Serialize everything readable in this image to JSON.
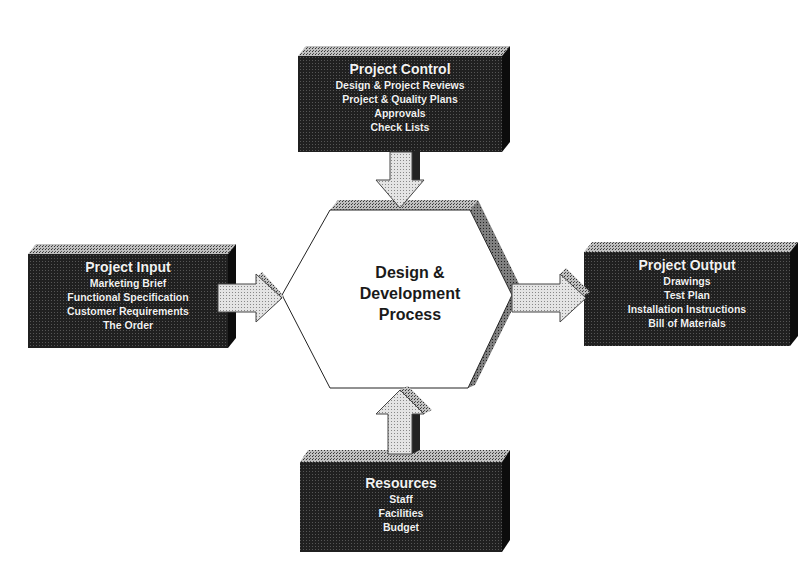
{
  "diagram": {
    "center": {
      "lines": [
        "Design &",
        "Development",
        "Process"
      ]
    },
    "boxes": {
      "top": {
        "title": "Project Control",
        "items": [
          "Design & Project Reviews",
          "Project & Quality Plans",
          "Approvals",
          "Check Lists"
        ]
      },
      "left": {
        "title": "Project Input",
        "items": [
          "Marketing Brief",
          "Functional Specification",
          "Customer Requirements",
          "The Order"
        ]
      },
      "right": {
        "title": "Project Output",
        "items": [
          "Drawings",
          "Test Plan",
          "Installation Instructions",
          "Bill of Materials"
        ]
      },
      "bottom": {
        "title": "Resources",
        "items": [
          "Staff",
          "Facilities",
          "Budget"
        ]
      }
    },
    "arrows": [
      {
        "from": "Project Control",
        "to": "Design & Development Process",
        "direction": "down"
      },
      {
        "from": "Project Input",
        "to": "Design & Development Process",
        "direction": "right"
      },
      {
        "from": "Design & Development Process",
        "to": "Project Output",
        "direction": "right"
      },
      {
        "from": "Resources",
        "to": "Design & Development Process",
        "direction": "up"
      }
    ],
    "colors": {
      "box_face": "#1e1e1e",
      "box_top": "#9a9a9a",
      "box_side": "#0c0c0c",
      "arrow_fill": "#d6d6d6",
      "hexagon_fill": "#ffffff",
      "hexagon_bevel": "#6e6e6e",
      "text_light": "#f2f2f2",
      "text_dark": "#1a1a1a"
    }
  }
}
